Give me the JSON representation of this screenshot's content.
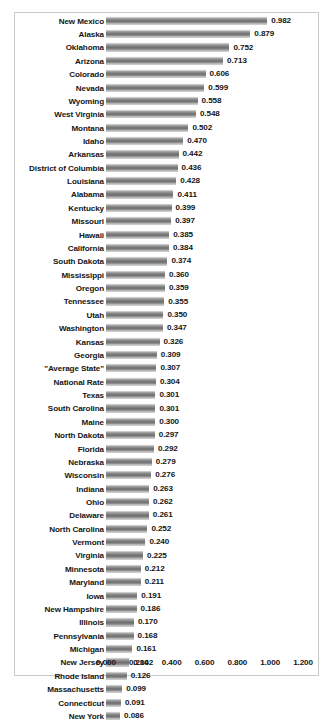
{
  "chart_data": {
    "type": "bar",
    "orientation": "horizontal",
    "title": "",
    "subtitle": "",
    "xlabel": "",
    "ylabel": "",
    "xlim": [
      0.0,
      1.2
    ],
    "grid": false,
    "legend": null,
    "value_label_format": "0.000",
    "axis_tick_labels": [
      "0.000",
      "0.200",
      "0.400",
      "0.600",
      "0.800",
      "1.000",
      "1.200"
    ],
    "axis_tick_values": [
      0.0,
      0.2,
      0.4,
      0.6,
      0.8,
      1.0,
      1.2
    ],
    "bar_color": "#868686",
    "text_color": "#151515",
    "frame_color": "#c9c9c9",
    "categories": [
      "New Mexico",
      "Alaska",
      "Oklahoma",
      "Arizona",
      "Colorado",
      "Nevada",
      "Wyoming",
      "West Virginia",
      "Montana",
      "Idaho",
      "Arkansas",
      "District of Columbia",
      "Louisiana",
      "Alabama",
      "Kentucky",
      "Missouri",
      "Hawaii",
      "California",
      "South Dakota",
      "Mississippi",
      "Oregon",
      "Tennessee",
      "Utah",
      "Washington",
      "Kansas",
      "Georgia",
      "\"Average State\"",
      "National Rate",
      "Texas",
      "South Carolina",
      "Maine",
      "North Dakota",
      "Florida",
      "Nebraska",
      "Wisconsin",
      "Indiana",
      "Ohio",
      "Delaware",
      "North Carolina",
      "Vermont",
      "Virginia",
      "Minnesota",
      "Maryland",
      "Iowa",
      "New Hampshire",
      "Illinois",
      "Pennsylvania",
      "Michigan",
      "New Jersey",
      "Rhode Island",
      "Massachusetts",
      "Connecticut",
      "New York"
    ],
    "values": [
      0.982,
      0.879,
      0.752,
      0.713,
      0.606,
      0.599,
      0.558,
      0.548,
      0.502,
      0.47,
      0.442,
      0.436,
      0.428,
      0.411,
      0.399,
      0.397,
      0.385,
      0.384,
      0.374,
      0.36,
      0.359,
      0.355,
      0.35,
      0.347,
      0.326,
      0.309,
      0.307,
      0.304,
      0.301,
      0.301,
      0.3,
      0.297,
      0.292,
      0.279,
      0.276,
      0.263,
      0.262,
      0.261,
      0.252,
      0.24,
      0.225,
      0.212,
      0.211,
      0.191,
      0.186,
      0.17,
      0.168,
      0.161,
      0.142,
      0.126,
      0.099,
      0.091,
      0.086
    ],
    "value_labels": [
      "0.982",
      "0.879",
      "0.752",
      "0.713",
      "0.606",
      "0.599",
      "0.558",
      "0.548",
      "0.502",
      "0.470",
      "0.442",
      "0.436",
      "0.428",
      "0.411",
      "0.399",
      "0.397",
      "0.385",
      "0.384",
      "0.374",
      "0.360",
      "0.359",
      "0.355",
      "0.350",
      "0.347",
      "0.326",
      "0.309",
      "0.307",
      "0.304",
      "0.301",
      "0.301",
      "0.300",
      "0.297",
      "0.292",
      "0.279",
      "0.276",
      "0.263",
      "0.262",
      "0.261",
      "0.252",
      "0.240",
      "0.225",
      "0.212",
      "0.211",
      "0.191",
      "0.186",
      "0.170",
      "0.168",
      "0.161",
      "0.142",
      "0.126",
      "0.099",
      "0.091",
      "0.086"
    ]
  }
}
